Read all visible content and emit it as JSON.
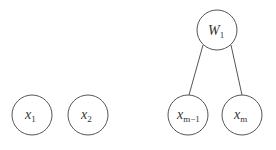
{
  "diagram": {
    "type": "graph",
    "nodes": [
      {
        "id": "x1",
        "base": "x",
        "sub": "1",
        "cx": 32,
        "cy": 115,
        "r": 20
      },
      {
        "id": "x2",
        "base": "x",
        "sub": "2",
        "cx": 88,
        "cy": 115,
        "r": 20
      },
      {
        "id": "xm1",
        "base": "x",
        "sub": "m−1",
        "cx": 188,
        "cy": 115,
        "r": 20
      },
      {
        "id": "xm",
        "base": "x",
        "sub": "m",
        "cx": 242,
        "cy": 115,
        "r": 20
      },
      {
        "id": "W1",
        "base": "W",
        "sub": "1",
        "cx": 217,
        "cy": 30,
        "r": 20
      }
    ],
    "edges": [
      {
        "from": "W1",
        "to": "xm1"
      },
      {
        "from": "W1",
        "to": "xm"
      }
    ],
    "colors": {
      "stroke": "#555555",
      "text": "#333333",
      "background": "#ffffff"
    }
  }
}
